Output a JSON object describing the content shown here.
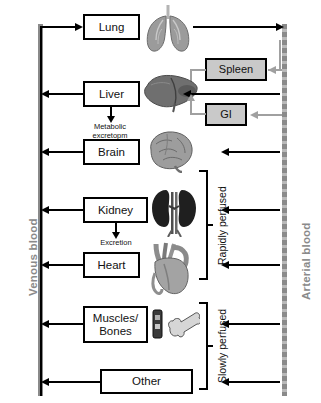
{
  "diagram": {
    "colors": {
      "vessel": "#8a8a8a",
      "arrow_black": "#000000",
      "arrow_grey": "#a0a0a0",
      "shaded_box_fill": "#c9c9c9",
      "background": "#ffffff"
    },
    "vessels": [
      {
        "id": "venous",
        "label": "Venous blood",
        "side": "left"
      },
      {
        "id": "arterial",
        "label": "Arterial blood",
        "side": "right"
      }
    ],
    "compartments": [
      {
        "id": "lung",
        "label": "Lung",
        "icon": "lungs-icon"
      },
      {
        "id": "liver",
        "label": "Liver",
        "icon": "liver-icon"
      },
      {
        "id": "brain",
        "label": "Brain",
        "icon": "brain-icon"
      },
      {
        "id": "kidney",
        "label": "Kidney",
        "icon": "kidneys-icon"
      },
      {
        "id": "heart",
        "label": "Heart",
        "icon": "heart-icon"
      },
      {
        "id": "muscles",
        "label": "Muscles/\nBones",
        "icon": "bone-icon"
      },
      {
        "id": "other",
        "label": "Other",
        "icon": "none"
      }
    ],
    "shaded_compartments": [
      {
        "id": "spleen",
        "label": "Spleen"
      },
      {
        "id": "gi",
        "label": "GI"
      }
    ],
    "elimination_labels": [
      {
        "id": "liver-elimination",
        "text": "Metabolic\nexcretopm",
        "from": "liver"
      },
      {
        "id": "kidney-elimination",
        "text": "Excretion",
        "from": "kidney"
      }
    ],
    "perfusion_groups": [
      {
        "id": "rapidly-perfused",
        "label": "Rapidly perfused",
        "members": [
          "brain",
          "kidney",
          "heart"
        ]
      },
      {
        "id": "slowly-perfused",
        "label": "Slowly perfused",
        "members": [
          "muscles",
          "other"
        ]
      }
    ]
  }
}
